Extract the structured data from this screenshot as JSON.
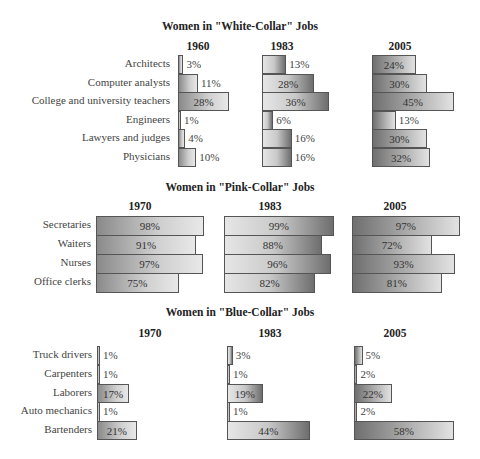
{
  "chart_data": [
    {
      "type": "bar",
      "title": "Women in \"White-Collar\" Jobs",
      "categories": [
        "Architects",
        "Computer analysts",
        "College and university teachers",
        "Engineers",
        "Lawyers and judges",
        "Physicians"
      ],
      "series": [
        {
          "name": "1960",
          "values": [
            3,
            11,
            28,
            1,
            4,
            10
          ]
        },
        {
          "name": "1983",
          "values": [
            13,
            28,
            36,
            6,
            16,
            16
          ]
        },
        {
          "name": "2005",
          "values": [
            24,
            30,
            45,
            13,
            30,
            32
          ]
        }
      ],
      "unit": "%"
    },
    {
      "type": "bar",
      "title": "Women in \"Pink-Collar\" Jobs",
      "categories": [
        "Secretaries",
        "Waiters",
        "Nurses",
        "Office clerks"
      ],
      "series": [
        {
          "name": "1970",
          "values": [
            98,
            91,
            97,
            75
          ]
        },
        {
          "name": "1983",
          "values": [
            99,
            88,
            96,
            82
          ]
        },
        {
          "name": "2005",
          "values": [
            97,
            72,
            93,
            81
          ]
        }
      ],
      "unit": "%"
    },
    {
      "type": "bar",
      "title": "Women in \"Blue-Collar\" Jobs",
      "categories": [
        "Truck drivers",
        "Carpenters",
        "Laborers",
        "Auto mechanics",
        "Bartenders"
      ],
      "series": [
        {
          "name": "1970",
          "values": [
            1,
            1,
            17,
            1,
            21
          ]
        },
        {
          "name": "1983",
          "values": [
            3,
            1,
            19,
            1,
            44
          ]
        },
        {
          "name": "2005",
          "values": [
            5,
            2,
            22,
            2,
            58
          ]
        }
      ],
      "unit": "%"
    }
  ],
  "layout": {
    "sections": [
      {
        "title_y": 20,
        "year_y": 40,
        "row_y0": 55,
        "row_h": 18.5,
        "label_right": 170,
        "cols": [
          {
            "x": 178,
            "scale": 1.82,
            "year_x": 178,
            "grad": "g1"
          },
          {
            "x": 262,
            "scale": 1.86,
            "year_x": 262,
            "grad": "g2"
          },
          {
            "x": 372,
            "scale": 1.82,
            "year_x": 380,
            "grad": "g3"
          }
        ]
      },
      {
        "title_y": 181,
        "year_y": 200,
        "row_y0": 216,
        "row_h": 19,
        "label_right": 91,
        "cols": [
          {
            "x": 96,
            "scale": 1.1,
            "year_x": 120,
            "grad": "g1"
          },
          {
            "x": 224,
            "scale": 1.11,
            "year_x": 250,
            "grad": "g2"
          },
          {
            "x": 352,
            "scale": 1.11,
            "year_x": 375,
            "grad": "g3"
          }
        ]
      },
      {
        "title_y": 306,
        "year_y": 327,
        "row_y0": 346,
        "row_h": 18.8,
        "label_right": 92,
        "cols": [
          {
            "x": 97,
            "scale": 1.9,
            "year_x": 130,
            "grad": "g1"
          },
          {
            "x": 227,
            "scale": 1.88,
            "year_x": 250,
            "grad": "g2"
          },
          {
            "x": 354,
            "scale": 1.72,
            "year_x": 375,
            "grad": "g3"
          }
        ]
      }
    ]
  }
}
